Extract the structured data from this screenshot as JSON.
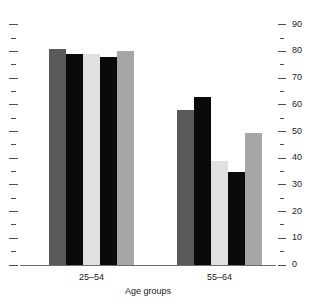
{
  "chart_data": {
    "type": "bar",
    "title": "",
    "subtitle": "",
    "xlabel": "Age groups",
    "ylabel": "",
    "ylim": [
      0,
      90
    ],
    "grid": false,
    "legend": "none",
    "y_axis_position": "right",
    "y_ticks_major": [
      0,
      10,
      20,
      30,
      40,
      50,
      60,
      70,
      80,
      90
    ],
    "y_ticks_minor": [
      5,
      15,
      25,
      35,
      45,
      55,
      65,
      75,
      85
    ],
    "y_tick_labels": [
      "0",
      "10",
      "20",
      "30",
      "40",
      "50",
      "60",
      "70",
      "80",
      "90"
    ],
    "categories": [
      "25–54",
      "55–64"
    ],
    "series": [
      {
        "name": "Series 1",
        "color": "#595959",
        "values": [
          81,
          58
        ]
      },
      {
        "name": "Series 2",
        "color": "#0a0a0a",
        "values": [
          79,
          63
        ]
      },
      {
        "name": "Series 3",
        "color": "#e0e0e0",
        "values": [
          79,
          39
        ]
      },
      {
        "name": "Series 4",
        "color": "#0a0a0a",
        "values": [
          78,
          35
        ]
      },
      {
        "name": "Series 5",
        "color": "#a6a6a6",
        "values": [
          80,
          49.5
        ]
      }
    ]
  },
  "colors": {
    "axis": "#6e6e6e",
    "tick": "#4d4d4d",
    "text": "#1a1a1a",
    "background": "#ffffff"
  }
}
